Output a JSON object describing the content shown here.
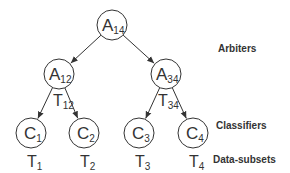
{
  "diagram": {
    "nodes": [
      {
        "id": "A14",
        "main": "A",
        "sub": "14",
        "cx": 112,
        "cy": 25,
        "r": 15
      },
      {
        "id": "A12",
        "main": "A",
        "sub": "12",
        "cx": 59,
        "cy": 74,
        "r": 15
      },
      {
        "id": "A34",
        "main": "A",
        "sub": "34",
        "cx": 166,
        "cy": 74,
        "r": 15
      },
      {
        "id": "C1",
        "main": "C",
        "sub": "1",
        "cx": 31,
        "cy": 133,
        "r": 15
      },
      {
        "id": "C2",
        "main": "C",
        "sub": "2",
        "cx": 84,
        "cy": 133,
        "r": 15
      },
      {
        "id": "C3",
        "main": "C",
        "sub": "3",
        "cx": 139,
        "cy": 133,
        "r": 15
      },
      {
        "id": "C4",
        "main": "C",
        "sub": "4",
        "cx": 193,
        "cy": 133,
        "r": 15
      }
    ],
    "edges": [
      {
        "from": "A14",
        "to": "A12"
      },
      {
        "from": "A14",
        "to": "A34"
      },
      {
        "from": "A12",
        "to": "C1"
      },
      {
        "from": "A12",
        "to": "C2"
      },
      {
        "from": "A34",
        "to": "C3"
      },
      {
        "from": "A34",
        "to": "C4"
      }
    ],
    "edge_labels": [
      {
        "main": "T",
        "sub": "12",
        "x": 53,
        "y": 106
      },
      {
        "main": "T",
        "sub": "34",
        "x": 158,
        "y": 106
      }
    ],
    "data_subsets": [
      {
        "main": "T",
        "sub": "1",
        "x": 27,
        "y": 167
      },
      {
        "main": "T",
        "sub": "2",
        "x": 80,
        "y": 167
      },
      {
        "main": "T",
        "sub": "3",
        "x": 135,
        "y": 167
      },
      {
        "main": "T",
        "sub": "4",
        "x": 189,
        "y": 167
      }
    ],
    "legend": {
      "arbiters": "Arbiters",
      "classifiers": "Classifiers",
      "data_subsets": "Data-subsets"
    },
    "colors": {
      "stroke": "#333333",
      "text": "#333333",
      "background": "#ffffff"
    }
  }
}
